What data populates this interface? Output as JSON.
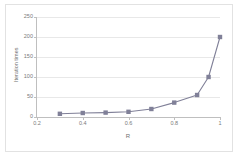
{
  "chart_data": {
    "type": "line",
    "title": "",
    "xlabel": "R",
    "ylabel": "Iteration times",
    "x": [
      0.3,
      0.4,
      0.5,
      0.6,
      0.7,
      0.8,
      0.9,
      0.95,
      1.0
    ],
    "values": [
      8,
      10,
      11,
      13,
      20,
      36,
      55,
      100,
      200
    ],
    "series": [
      {
        "name": "Iteration times",
        "values": [
          8,
          10,
          11,
          13,
          20,
          36,
          55,
          100,
          200
        ]
      }
    ],
    "xlim": [
      0.2,
      1.0
    ],
    "ylim": [
      0,
      250
    ],
    "xticks": [
      0.2,
      0.4,
      0.6,
      0.8,
      1.0
    ],
    "xtick_labels": [
      "0.2",
      "0.4",
      "0.6",
      "0.8",
      "1"
    ],
    "yticks": [
      0,
      50,
      100,
      150,
      200,
      250
    ],
    "ytick_labels": [
      "0",
      "50",
      "100",
      "150",
      "200",
      "250"
    ],
    "grid": "horizontal",
    "legend": "none",
    "marker": "square",
    "series_color": "#808098",
    "line_color": "#808098",
    "grid_color": "#e8e8e8",
    "axis_color": "#bfbfbf",
    "tick_label_color": "#7a7a7a",
    "background_color": "#ffffff",
    "border_color": "#e2e2e2"
  }
}
